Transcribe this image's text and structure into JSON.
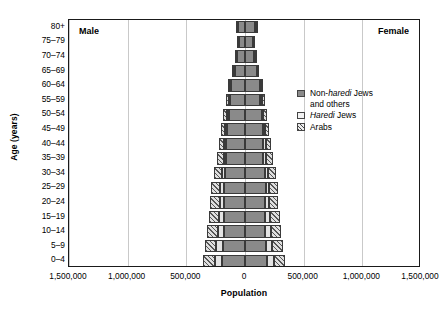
{
  "chart_data": {
    "type": "bar",
    "subtype": "population-pyramid-stacked",
    "title": "",
    "xlabel": "Population",
    "ylabel": "Age (years)",
    "side_labels": {
      "left": "Male",
      "right": "Female"
    },
    "categories": [
      "0–4",
      "5–9",
      "10–14",
      "15–19",
      "20–24",
      "25–29",
      "30–34",
      "35–39",
      "40–44",
      "45–49",
      "50–54",
      "55–59",
      "60–64",
      "65–69",
      "70–74",
      "75–79",
      "80+"
    ],
    "xlim": [
      -1500000,
      1500000
    ],
    "xticks": [
      -1500000,
      -1000000,
      -500000,
      0,
      500000,
      1000000,
      1500000
    ],
    "xtick_labels": [
      "1,500,000",
      "1,000,000",
      "500,000",
      "0",
      "500,000",
      "1,000,000",
      "1,500,000"
    ],
    "grid": true,
    "legend_position": "right-center",
    "series": [
      {
        "name": "Non-haredi Jews and others",
        "color": "#8a8a8a",
        "pattern": "solid",
        "male": [
          195000,
          190000,
          183000,
          180000,
          178000,
          183000,
          172000,
          160000,
          158000,
          152000,
          140000,
          128000,
          120000,
          92000,
          68000,
          55000,
          62000
        ],
        "female": [
          186000,
          181000,
          174000,
          172000,
          170000,
          176000,
          168000,
          157000,
          156000,
          152000,
          142000,
          131000,
          125000,
          99000,
          77000,
          66000,
          85000
        ]
      },
      {
        "name": "Haredi Jews",
        "color": "#e3e3e3",
        "pattern": "solid",
        "male": [
          62000,
          55000,
          47000,
          40000,
          33000,
          29000,
          26000,
          22000,
          18000,
          15000,
          12000,
          10000,
          8000,
          6000,
          4500,
          3500,
          3500
        ],
        "female": [
          60000,
          53000,
          46000,
          39000,
          33000,
          30000,
          27000,
          23000,
          19000,
          16000,
          13000,
          11000,
          9000,
          7000,
          5500,
          4500,
          5000
        ]
      },
      {
        "name": "Arabs",
        "color": "#dedede",
        "pattern": "diagonal-hatch",
        "male": [
          98000,
          96000,
          93000,
          90000,
          85000,
          78000,
          68000,
          57000,
          48000,
          40000,
          33000,
          27000,
          21000,
          15000,
          11000,
          8000,
          8000
        ],
        "female": [
          93000,
          91000,
          89000,
          86000,
          81000,
          75000,
          66000,
          56000,
          47000,
          40000,
          33000,
          28000,
          22000,
          16000,
          12000,
          9000,
          10000
        ]
      }
    ]
  },
  "legend": {
    "items": [
      {
        "label_main": "Non-",
        "label_italic": "haredi",
        "label_tail": " Jews",
        "label_line2": "and others",
        "key": "nonharedi"
      },
      {
        "label_italic": "Haredi",
        "label_tail": " Jews",
        "key": "haredi"
      },
      {
        "label_main": "Arabs",
        "key": "arabs"
      }
    ]
  },
  "icons": {
    "legend_swatch_nonharedi": "filled-square-icon",
    "legend_swatch_haredi": "empty-square-icon",
    "legend_swatch_arabs": "hatched-square-icon"
  }
}
